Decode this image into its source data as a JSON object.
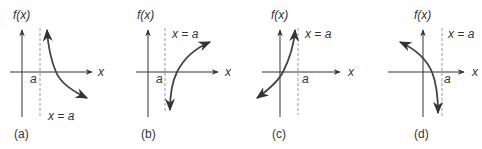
{
  "figure": {
    "panels": [
      {
        "id": "a",
        "caption": "(a)",
        "y_axis_label": "f(x)",
        "x_axis_label": "x",
        "tick_label": "a",
        "asymptote_label": "x = a",
        "description": "Curve right of x=a, approaching +infinity near asymptote, decreasing toward lower right"
      },
      {
        "id": "b",
        "caption": "(b)",
        "y_axis_label": "f(x)",
        "x_axis_label": "x",
        "tick_label": "a",
        "asymptote_label": "x = a",
        "description": "Curve right of x=a, approaching -infinity near asymptote, increasing toward upper right"
      },
      {
        "id": "c",
        "caption": "(c)",
        "y_axis_label": "f(x)",
        "x_axis_label": "x",
        "tick_label": "a",
        "asymptote_label": "x = a",
        "description": "Curve left of x=a, approaching +infinity near asymptote, coming from lower left"
      },
      {
        "id": "d",
        "caption": "(d)",
        "y_axis_label": "f(x)",
        "x_axis_label": "x",
        "tick_label": "a",
        "asymptote_label": "x = a",
        "description": "Curve left of x=a, approaching -infinity near asymptote, coming from upper left"
      }
    ],
    "colors": {
      "axis": "#333333",
      "asymptote": "#9a9a9a",
      "curve": "#444444",
      "text": "#333333"
    }
  }
}
